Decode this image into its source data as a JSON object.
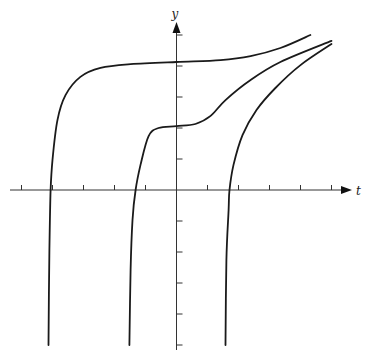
{
  "chart_data": {
    "type": "line",
    "title": "",
    "xlabel": "t",
    "ylabel": "y",
    "xlim": [
      -5.3,
      5.3
    ],
    "ylim": [
      -5.4,
      5.2
    ],
    "x_ticks": [
      -5,
      -4,
      -3,
      -2,
      -1,
      1,
      2,
      3,
      4,
      5
    ],
    "y_ticks": [
      -5,
      -4,
      -3,
      -2,
      -1,
      1,
      2,
      3,
      4,
      5
    ],
    "tick_labels_shown": false,
    "grid": false,
    "legend": "none",
    "series": [
      {
        "name": "solution-curve-1",
        "color": "#1a1a1a",
        "points": [
          [
            -4.13,
            -5.0
          ],
          [
            -4.1,
            -1.94
          ],
          [
            -4.06,
            0.0
          ],
          [
            -4.0,
            0.97
          ],
          [
            -3.84,
            2.26
          ],
          [
            -3.58,
            3.06
          ],
          [
            -3.1,
            3.65
          ],
          [
            -2.45,
            3.94
          ],
          [
            -1.48,
            4.06
          ],
          [
            0.0,
            4.13
          ],
          [
            1.42,
            4.19
          ],
          [
            2.39,
            4.32
          ],
          [
            3.35,
            4.58
          ],
          [
            4.32,
            5.0
          ]
        ]
      },
      {
        "name": "solution-curve-2",
        "color": "#1a1a1a",
        "points": [
          [
            -1.52,
            -5.0
          ],
          [
            -1.48,
            -2.58
          ],
          [
            -1.42,
            -0.97
          ],
          [
            -1.32,
            0.0
          ],
          [
            -1.16,
            0.81
          ],
          [
            -0.9,
            1.74
          ],
          [
            -0.58,
            2.0
          ],
          [
            0.0,
            2.06
          ],
          [
            0.61,
            2.13
          ],
          [
            1.1,
            2.39
          ],
          [
            1.58,
            2.9
          ],
          [
            2.39,
            3.55
          ],
          [
            3.35,
            4.13
          ],
          [
            5.0,
            4.81
          ]
        ]
      },
      {
        "name": "solution-curve-3",
        "color": "#1a1a1a",
        "points": [
          [
            1.58,
            -5.0
          ],
          [
            1.61,
            -2.26
          ],
          [
            1.68,
            -0.65
          ],
          [
            1.71,
            0.0
          ],
          [
            1.84,
            0.81
          ],
          [
            2.13,
            1.77
          ],
          [
            2.58,
            2.58
          ],
          [
            3.19,
            3.29
          ],
          [
            4.0,
            4.03
          ],
          [
            5.0,
            4.71
          ]
        ]
      }
    ]
  }
}
